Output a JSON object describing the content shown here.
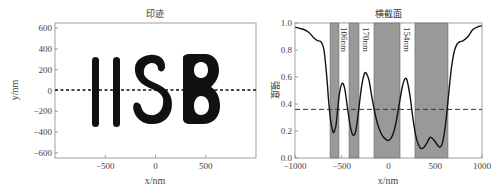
{
  "chart_data": [
    {
      "type": "scatter",
      "title": "印迹",
      "xlabel": "x/nm",
      "ylabel": "y/nm",
      "xlim": [
        -1000,
        1000
      ],
      "ylim": [
        -650,
        650
      ],
      "xticks": [
        -500,
        0,
        500
      ],
      "xtick_labels": [
        "−500",
        "0",
        "500"
      ],
      "yticks": [
        600,
        400,
        200,
        0,
        -200,
        -400,
        -600
      ],
      "ytick_labels": [
        "600",
        "400",
        "200",
        "0",
        "−200",
        "−400",
        "−600"
      ],
      "grid": false,
      "content": "Black imprint pattern of letters 'IISB' spanning roughly x = -650 to 650 nm, y = -280 to 300 nm",
      "pattern_text": "IISB",
      "reference_line": {
        "y": 0,
        "style": "dashed",
        "color": "#000000"
      }
    },
    {
      "type": "line",
      "title": "横截面",
      "xlabel": "x/nm",
      "ylabel": "强度",
      "xlim": [
        -1000,
        1000
      ],
      "ylim": [
        0.0,
        1.0
      ],
      "xticks": [
        -1000,
        -500,
        0,
        500,
        1000
      ],
      "xtick_labels": [
        "−1000",
        "−500",
        "0",
        "500",
        "1000"
      ],
      "yticks": [
        0.0,
        0.2,
        0.4,
        0.6,
        0.8,
        1.0
      ],
      "ytick_labels": [
        "0.0",
        "0.2",
        "0.4",
        "0.6",
        "0.8",
        "1.0"
      ],
      "grid": false,
      "series": [
        {
          "name": "intensity",
          "color": "#111111",
          "x": [
            -1000,
            -950,
            -900,
            -850,
            -800,
            -760,
            -720,
            -690,
            -660,
            -640,
            -620,
            -600,
            -585,
            -560,
            -530,
            -500,
            -470,
            -440,
            -410,
            -380,
            -350,
            -320,
            -290,
            -260,
            -240,
            -210,
            -180,
            -150,
            -120,
            -90,
            -60,
            -30,
            -10,
            20,
            50,
            80,
            110,
            140,
            160,
            180,
            200,
            230,
            260,
            290,
            320,
            350,
            380,
            410,
            440,
            460,
            490,
            520,
            550,
            580,
            610,
            640,
            670,
            700,
            730,
            760,
            800,
            850,
            900,
            950,
            1000
          ],
          "y": [
            0.97,
            0.96,
            0.95,
            0.93,
            0.89,
            0.87,
            0.86,
            0.8,
            0.6,
            0.42,
            0.28,
            0.21,
            0.19,
            0.25,
            0.45,
            0.55,
            0.52,
            0.38,
            0.24,
            0.17,
            0.2,
            0.35,
            0.52,
            0.62,
            0.63,
            0.58,
            0.46,
            0.35,
            0.26,
            0.2,
            0.16,
            0.14,
            0.13,
            0.14,
            0.18,
            0.26,
            0.38,
            0.5,
            0.56,
            0.59,
            0.57,
            0.46,
            0.3,
            0.17,
            0.1,
            0.07,
            0.08,
            0.11,
            0.15,
            0.15,
            0.13,
            0.1,
            0.08,
            0.12,
            0.25,
            0.45,
            0.65,
            0.78,
            0.84,
            0.86,
            0.87,
            0.9,
            0.95,
            0.97,
            0.98
          ]
        }
      ],
      "threshold_line": {
        "y": 0.36,
        "style": "dashed",
        "color": "#333333"
      },
      "shaded_regions": [
        {
          "x0": -625,
          "x1": -530,
          "color": "#999999"
        },
        {
          "x0": -422,
          "x1": -316,
          "color": "#999999"
        },
        {
          "x0": -155,
          "x1": 123,
          "color": "#999999"
        },
        {
          "x0": 283,
          "x1": 636,
          "color": "#999999"
        }
      ],
      "annotations": [
        {
          "text": "106nm",
          "x": -480,
          "orientation": "vertical"
        },
        {
          "text": "170nm",
          "x": -240,
          "orientation": "vertical"
        },
        {
          "text": "154nm",
          "x": 200,
          "orientation": "vertical"
        }
      ]
    }
  ]
}
